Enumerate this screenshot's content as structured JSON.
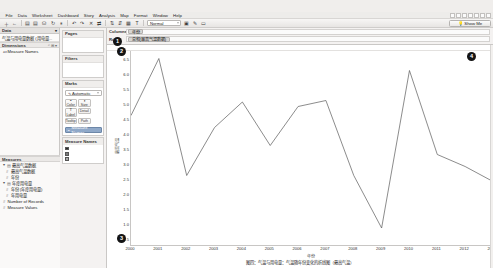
{
  "app": {
    "title": "Tableau Desktop",
    "menu": [
      "File",
      "Data",
      "Worksheet",
      "Dashboard",
      "Story",
      "Analysis",
      "Map",
      "Format",
      "Window",
      "Help"
    ]
  },
  "toolbar": {
    "buttons": [
      {
        "name": "new-worksheet",
        "glyph": "＋"
      },
      {
        "name": "back",
        "glyph": "←"
      },
      {
        "name": "save",
        "glyph": "▤"
      },
      {
        "name": "connect-data",
        "glyph": "▤"
      },
      {
        "name": "new-data-source",
        "glyph": "⛁"
      },
      {
        "name": "refresh-data",
        "glyph": "↻"
      },
      {
        "name": "pause-updates",
        "glyph": "⏸"
      },
      {
        "name": "undo",
        "glyph": "↶"
      },
      {
        "name": "redo",
        "glyph": "↷"
      },
      {
        "name": "clear-sheet",
        "glyph": "✕"
      },
      {
        "name": "swap-rows-columns",
        "glyph": "⇄"
      },
      {
        "name": "sort-ascending",
        "glyph": "⇅"
      },
      {
        "name": "sort-descending",
        "glyph": "⇵"
      },
      {
        "name": "group-members",
        "glyph": "▦"
      },
      {
        "name": "show-mark-labels",
        "glyph": "T"
      },
      {
        "name": "fix-axes",
        "glyph": "▣"
      },
      {
        "name": "highlight",
        "glyph": "✎"
      },
      {
        "name": "presentation-mode",
        "glyph": "▭"
      }
    ],
    "fit_select": "Normal",
    "fit_options": [
      "Normal",
      "Fit Width",
      "Fit Height",
      "Entire View"
    ]
  },
  "show_me": {
    "label": "Show Me",
    "icon": "lightbulb-icon",
    "cells": 7
  },
  "data_panel": {
    "title": "Data",
    "datasource": "气温与用电量数据 (用电量...",
    "dimensions": {
      "title": "Dimensions",
      "tools": [
        "⌕",
        "⊞",
        "▾"
      ],
      "items": [
        {
          "label": "Measure Names",
          "icon": "abc-icon"
        }
      ]
    },
    "measures": {
      "title": "Measures",
      "items": [
        {
          "label": "最高气温数据",
          "icon": "folder-icon",
          "indent": 0,
          "expander": "▾"
        },
        {
          "label": "最高气温数据",
          "icon": "hash-icon",
          "indent": 1,
          "expander": ""
        },
        {
          "label": "年份",
          "icon": "hash-icon",
          "indent": 1,
          "expander": ""
        },
        {
          "label": "年度用电量",
          "icon": "folder-icon",
          "indent": 0,
          "expander": "▾"
        },
        {
          "label": "年份 (年度用电量)",
          "icon": "hash-icon",
          "indent": 1,
          "expander": ""
        },
        {
          "label": "年用电量",
          "icon": "hash-icon",
          "indent": 1,
          "expander": ""
        },
        {
          "label": "Number of Records",
          "icon": "hash-icon",
          "indent": 0,
          "expander": ""
        },
        {
          "label": "Measure Values",
          "icon": "hash-icon",
          "indent": 0,
          "expander": ""
        }
      ]
    }
  },
  "cards_panel": {
    "pages": {
      "title": "Pages",
      "body": ""
    },
    "filters": {
      "title": "Filters",
      "body": ""
    },
    "marks": {
      "title": "Marks",
      "mark_type": "Automatic",
      "mark_type_icon": "line-mark-icon",
      "mark_type_options": [
        "Automatic",
        "Bar",
        "Line",
        "Area",
        "Square",
        "Circle",
        "Shape",
        "Text",
        "Map",
        "Pie",
        "Gantt Bar",
        "Polygon"
      ],
      "property_buttons": [
        {
          "label": "Color",
          "icon": "color-icon",
          "glyph": "🎨"
        },
        {
          "label": "Size",
          "icon": "size-icon",
          "glyph": "⬍"
        },
        {
          "label": "Label",
          "icon": "label-icon",
          "glyph": "T"
        },
        {
          "label": "Detail",
          "icon": "detail-icon",
          "glyph": "⋮"
        },
        {
          "label": "Tooltip",
          "icon": "tooltip-icon",
          "glyph": "▭"
        },
        {
          "label": "Path",
          "icon": "path-icon",
          "glyph": "∿"
        }
      ],
      "pills": [
        {
          "label": "Measure Names",
          "icon": "color-pill-icon"
        }
      ]
    },
    "legend": {
      "title": "Measure Names",
      "rows": [
        {
          "label": "",
          "color": "#2a2a2a"
        },
        {
          "label": "",
          "color": "#7a7a7a"
        },
        {
          "label": "",
          "color": "#a9a9a9"
        },
        {
          "label": "",
          "color": "#c8c8c8"
        },
        {
          "label": "",
          "color": "#5a5a5a"
        },
        {
          "label": "",
          "color": "#8e8e8e"
        }
      ]
    }
  },
  "shelves": {
    "columns": {
      "label": "Columns",
      "pills": [
        "年份"
      ]
    },
    "rows": {
      "label": "Rows",
      "pills": [
        "总和(最高气温数据)"
      ]
    }
  },
  "badges": [
    {
      "n": "1",
      "name": "badge-rows-shelf",
      "x": 113,
      "y": 37
    },
    {
      "n": "2",
      "name": "badge-y-axis",
      "x": 117,
      "y": 47
    },
    {
      "n": "3",
      "name": "badge-x-axis",
      "x": 117,
      "y": 234
    },
    {
      "n": "4",
      "name": "badge-plot-area",
      "x": 467,
      "y": 52
    }
  ],
  "chart_data": {
    "type": "line",
    "title": "",
    "xlabel": "年份",
    "ylabel": "最高气温",
    "x": [
      2000,
      2001,
      2002,
      2003,
      2004,
      2005,
      2006,
      2007,
      2008,
      2009,
      2010,
      2011,
      2012,
      2013
    ],
    "values": [
      4.6,
      6.5,
      2.6,
      4.2,
      5.05,
      3.6,
      4.9,
      5.1,
      2.6,
      0.85,
      6.1,
      3.3,
      2.9,
      2.4
    ],
    "series": [
      {
        "name": "总和(最高气温数据)",
        "color": "#5a5a5a",
        "values": [
          4.6,
          6.5,
          2.6,
          4.2,
          5.05,
          3.6,
          4.9,
          5.1,
          2.6,
          0.85,
          6.1,
          3.3,
          2.9,
          2.4
        ]
      }
    ],
    "yticks": [
      6.5,
      6.0,
      5.5,
      5.0,
      4.5,
      4.0,
      3.5,
      3.0,
      2.5,
      2.0,
      1.5,
      1.0,
      0.5
    ],
    "ytick_labels": [
      "6.5",
      "6.0",
      "5.5",
      "5.0",
      "4.5",
      "4.0",
      "3.5",
      "3.0",
      "2.5",
      "2.0",
      "1.5",
      "1.0",
      "0.5"
    ],
    "xtick_labels": [
      "2000",
      "2001",
      "2002",
      "2003",
      "2004",
      "2005",
      "2006",
      "2007",
      "2008",
      "2009",
      "2010",
      "2011",
      "2012",
      "2013"
    ],
    "ylim": [
      0.25,
      6.75
    ],
    "xlim": [
      2000,
      2013
    ],
    "grid": false,
    "legend_position": "right"
  },
  "caption": "图四：气温与用电量：气温随年份变化的折线图（最高气温）"
}
